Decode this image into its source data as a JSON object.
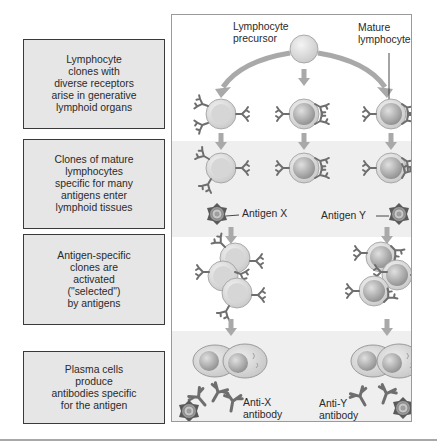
{
  "figure": {
    "steps": [
      {
        "id": "generation",
        "text": "Lymphocyte\nclones with\ndiverse receptors\narise in generative\nlymphoid organs"
      },
      {
        "id": "maturation",
        "text": "Clones of mature\nlymphocytes\nspecific for many\nantigens enter\nlymphoid tissues"
      },
      {
        "id": "selection",
        "text": "Antigen-specific\nclones are\nactivated\n(\"selected\")\nby antigens"
      },
      {
        "id": "effector",
        "text": "Plasma cells\nproduce\nantibodies specific\nfor the antigen"
      }
    ],
    "labels": {
      "precursor": "Lymphocyte\nprecursor",
      "mature": "Mature\nlymphocyte",
      "antigen_x": "Antigen X",
      "antigen_y": "Antigen Y",
      "anti_x": "Anti-X\nantibody",
      "anti_y": "Anti-Y\nantibody"
    },
    "colors": {
      "box_fill": "#e6e6e6",
      "band_fill": "#efefef",
      "cell_outer": "#d6d6d6",
      "cell_inner": "#b8b8b8",
      "arrow": "#a9a9a9",
      "receptor": "#6e6e6e",
      "antigen": "#5a5a5a"
    }
  }
}
